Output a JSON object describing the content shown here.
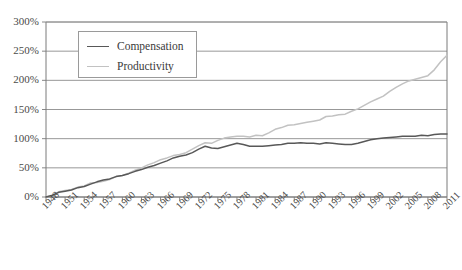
{
  "chart_data": {
    "type": "line",
    "title": "",
    "subtitle": "",
    "xlabel": "",
    "ylabel": "",
    "xlim": [
      1948,
      2011
    ],
    "ylim": [
      0,
      300
    ],
    "y_tick_values": [
      0,
      50,
      100,
      150,
      200,
      250,
      300
    ],
    "y_tick_labels": [
      "0%",
      "50%",
      "100%",
      "150%",
      "200%",
      "250%",
      "300%"
    ],
    "x_tick_values": [
      1948,
      1951,
      1954,
      1957,
      1960,
      1963,
      1966,
      1969,
      1972,
      1975,
      1978,
      1981,
      1984,
      1987,
      1990,
      1993,
      1996,
      1999,
      2002,
      2005,
      2008,
      2011
    ],
    "x_tick_labels": [
      "1948",
      "1951",
      "1954",
      "1957",
      "1960",
      "1963",
      "1966",
      "1969",
      "1972",
      "1975",
      "1978",
      "1981",
      "1984",
      "1987",
      "1990",
      "1993",
      "1996",
      "1999",
      "2002",
      "2005",
      "2008",
      "2011"
    ],
    "grid": "horizontal",
    "legend_position": "top-left-inside",
    "x": [
      1948,
      1949,
      1950,
      1951,
      1952,
      1953,
      1954,
      1955,
      1956,
      1957,
      1958,
      1959,
      1960,
      1961,
      1962,
      1963,
      1964,
      1965,
      1966,
      1967,
      1968,
      1969,
      1970,
      1971,
      1972,
      1973,
      1974,
      1975,
      1976,
      1977,
      1978,
      1979,
      1980,
      1981,
      1982,
      1983,
      1984,
      1985,
      1986,
      1987,
      1988,
      1989,
      1990,
      1991,
      1992,
      1993,
      1994,
      1995,
      1996,
      1997,
      1998,
      1999,
      2000,
      2001,
      2002,
      2003,
      2004,
      2005,
      2006,
      2007,
      2008,
      2009,
      2010,
      2011
    ],
    "series": [
      {
        "name": "Compensation",
        "color": "#585858",
        "values": [
          0,
          3,
          8,
          10,
          12,
          16,
          18,
          22,
          26,
          29,
          31,
          35,
          37,
          40,
          44,
          47,
          51,
          54,
          58,
          62,
          67,
          70,
          72,
          76,
          82,
          87,
          84,
          83,
          86,
          89,
          92,
          90,
          87,
          87,
          87,
          88,
          89,
          90,
          92,
          92,
          93,
          92,
          92,
          91,
          93,
          92,
          91,
          90,
          90,
          92,
          95,
          98,
          100,
          101,
          102,
          103,
          104,
          104,
          104,
          106,
          105,
          107,
          108,
          108
        ]
      },
      {
        "name": "Productivity",
        "color": "#c2c2c2",
        "values": [
          0,
          2,
          9,
          11,
          13,
          17,
          19,
          24,
          25,
          27,
          30,
          35,
          37,
          41,
          46,
          50,
          55,
          59,
          64,
          67,
          71,
          73,
          76,
          82,
          88,
          93,
          92,
          97,
          101,
          103,
          104,
          104,
          103,
          106,
          105,
          110,
          116,
          119,
          123,
          124,
          126,
          128,
          130,
          132,
          138,
          139,
          141,
          142,
          147,
          151,
          157,
          163,
          168,
          173,
          181,
          188,
          194,
          199,
          202,
          205,
          208,
          218,
          232,
          243
        ]
      }
    ]
  },
  "legend": {
    "items": [
      {
        "label": "Compensation",
        "color": "#585858"
      },
      {
        "label": "Productivity",
        "color": "#c2c2c2"
      }
    ]
  },
  "axes": {
    "frame_color": "#7a7a7a",
    "grid_color": "#8c8c8c"
  }
}
